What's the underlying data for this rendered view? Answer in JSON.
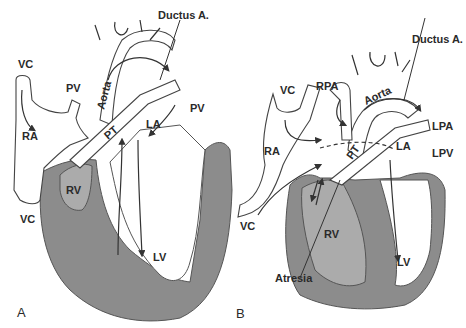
{
  "figure": {
    "panels": [
      {
        "id": "A",
        "label": "A",
        "structures": {
          "ductus": "Ductus A.",
          "vc_top": "VC",
          "vc_bottom": "VC",
          "pv_left": "PV",
          "pv_right": "PV",
          "aorta": "Aorta",
          "ra": "RA",
          "pt": "PT",
          "la": "LA",
          "rv": "RV",
          "lv": "LV"
        }
      },
      {
        "id": "B",
        "label": "B",
        "structures": {
          "ductus": "Ductus A.",
          "rpa": "RPA",
          "vc_top": "VC",
          "vc_bottom": "VC",
          "aorta": "Aorta",
          "lpa": "LPA",
          "ra": "RA",
          "pt": "PT",
          "la": "LA",
          "lpv": "LPV",
          "rv": "RV",
          "lv": "LV",
          "atresia": "Atresia"
        }
      }
    ],
    "colors": {
      "myocardium": "#8c8c8c",
      "right_ventricle": "#ababab",
      "outline": "#444444",
      "background": "#ffffff"
    }
  }
}
